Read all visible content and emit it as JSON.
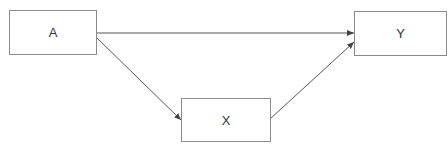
{
  "diagram": {
    "nodes": [
      {
        "id": "A",
        "label": "A"
      },
      {
        "id": "X",
        "label": "X"
      },
      {
        "id": "Y",
        "label": "Y"
      }
    ],
    "edges": [
      {
        "from": "A",
        "to": "Y"
      },
      {
        "from": "A",
        "to": "X"
      },
      {
        "from": "X",
        "to": "Y"
      }
    ],
    "colors": {
      "stroke": "#8a8a8a",
      "edge": "#555555",
      "text": "#333333"
    }
  }
}
